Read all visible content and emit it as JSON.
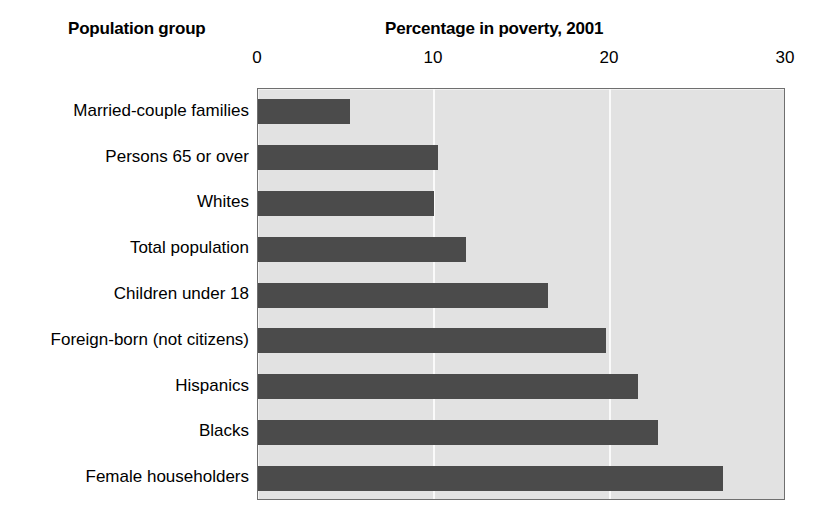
{
  "headers": {
    "group_header": "Population group",
    "chart_title": "Percentage in poverty, 2001"
  },
  "chart_data": {
    "type": "bar",
    "orientation": "horizontal",
    "title": "Percentage in poverty, 2001",
    "xlabel": "",
    "ylabel": "Population group",
    "xlim": [
      0,
      30
    ],
    "xticks": [
      0,
      10,
      20,
      30
    ],
    "xtick_labels": [
      "0",
      "10",
      "20",
      "30"
    ],
    "gridlines": [
      10,
      20
    ],
    "grid": true,
    "legend": null,
    "bar_color": "#4b4b4b",
    "plot_background": "#e2e2e2",
    "categories": [
      "Married-couple families",
      "Persons 65 or over",
      "Whites",
      "Total population",
      "Children under 18",
      "Foreign-born (not citizens)",
      "Hispanics",
      "Blacks",
      "Female householders"
    ],
    "values": [
      5.2,
      10.2,
      10.0,
      11.8,
      16.5,
      19.8,
      21.6,
      22.7,
      26.4
    ]
  }
}
